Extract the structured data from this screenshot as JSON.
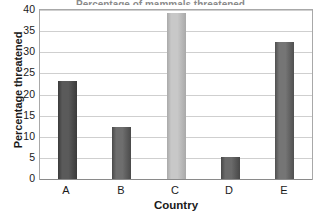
{
  "chart_data": {
    "type": "bar",
    "title": "",
    "title_partial_cutoff": "Percentage of mammals threatened",
    "categories": [
      "A",
      "B",
      "C",
      "D",
      "E"
    ],
    "values": [
      23.2,
      12.2,
      39.4,
      5.3,
      32.4
    ],
    "xlabel": "Country",
    "ylabel": "Percentage threatened",
    "ylim": [
      0,
      40
    ],
    "ytick_labels": [
      "0",
      "5",
      "10",
      "15",
      "20",
      "25",
      "30",
      "35",
      "40"
    ],
    "ytick_values": [
      0,
      5,
      10,
      15,
      20,
      25,
      30,
      35,
      40
    ],
    "grid": true,
    "grid_axis": "y",
    "legend": "none",
    "bar_colors": [
      "#5a5a5a",
      "#6e6e6e",
      "#c8c8c8",
      "#6a6a6a",
      "#757575"
    ],
    "bar_edge_colors": [
      "#3a3a3a",
      "#4a4a4a",
      "#a9a9a9",
      "#474747",
      "#505050"
    ],
    "plot_border_color": "#a8a8a8",
    "gridline_color": "#cfcfcf",
    "background_color": "#ffffff",
    "text_color": "#1a1a1a"
  }
}
